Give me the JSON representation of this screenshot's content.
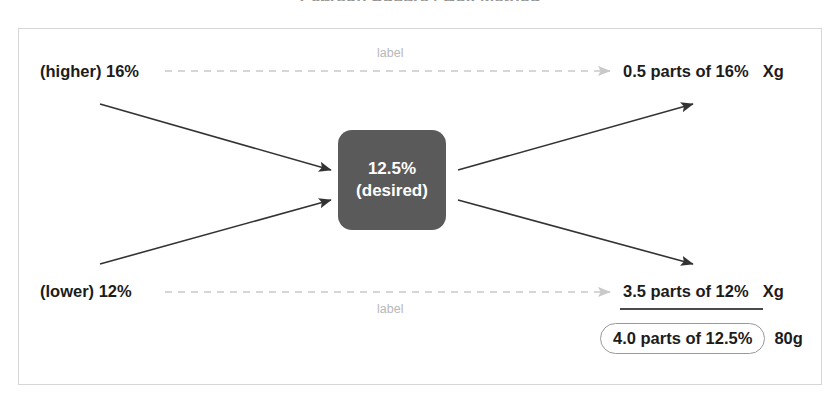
{
  "diagram": {
    "title_remnant": "Pearson Square / Box Method",
    "frame_border_color": "#d6d6d6",
    "center_node": {
      "line1": "12.5%",
      "line2": "(desired)",
      "fill_color": "#5a5a5a",
      "text_color": "#ffffff"
    },
    "inputs": [
      {
        "id": "higher",
        "label": "(higher) 16%"
      },
      {
        "id": "lower",
        "label": "(lower) 12%"
      }
    ],
    "outputs": [
      {
        "id": "parts-16",
        "amount": "0.5 parts of 16%",
        "unit": "Xg"
      },
      {
        "id": "parts-12",
        "amount": "3.5 parts of 12%",
        "unit": "Xg"
      }
    ],
    "total": {
      "amount": "4.0 parts of 12.5%",
      "unit": "80g"
    },
    "dashed_labels": [
      {
        "id": "top",
        "text": "label"
      },
      {
        "id": "bottom",
        "text": "label"
      }
    ],
    "colors": {
      "arrow": "#333333",
      "dashed_arrow": "#c9c9c9",
      "label_text": "#b8b8b8",
      "body_text": "#1c1c1c",
      "pill_border": "#9a9a9a",
      "underline": "#4a4a4a"
    }
  }
}
